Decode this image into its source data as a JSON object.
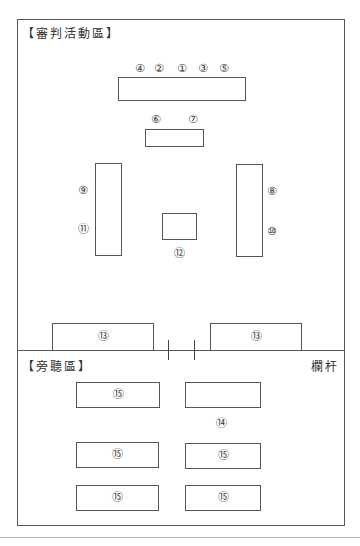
{
  "diagram": {
    "zones": {
      "trial_area_label": "【審判活動區】",
      "gallery_label": "【旁聽區】",
      "railing_label": "欄杆"
    },
    "markers": {
      "m1": "①",
      "m2": "②",
      "m3": "③",
      "m4": "④",
      "m5": "⑤",
      "m6": "⑥",
      "m7": "⑦",
      "m8": "⑧",
      "m9": "⑨",
      "m10": "⑩",
      "m11": "⑪",
      "m12": "⑫",
      "m13a": "⑬",
      "m13b": "⑬",
      "m14": "⑭",
      "m15a": "⑮",
      "m15b": "⑮",
      "m15c": "⑮",
      "m15d": "⑮",
      "m15e": "⑮"
    },
    "top_row_order": [
      "④",
      "②",
      "①",
      "③",
      "⑤"
    ],
    "gallery_rows": [
      [
        "⑮",
        ""
      ],
      [
        "⑮",
        "⑮"
      ],
      [
        "⑮",
        "⑮"
      ]
    ],
    "colors": {
      "line": "#555555",
      "text": "#333333",
      "background": "#ffffff"
    }
  }
}
